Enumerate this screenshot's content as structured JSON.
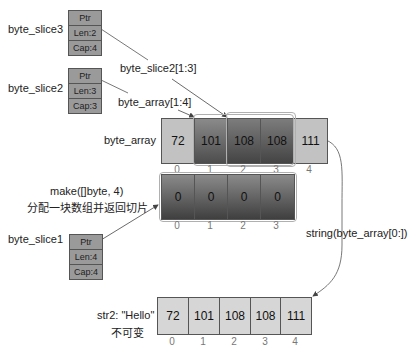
{
  "slices": {
    "byte_slice3": {
      "name": "byte_slice3",
      "ptr": "Ptr",
      "len": "Len:2",
      "cap": "Cap:4"
    },
    "byte_slice2": {
      "name": "byte_slice2",
      "ptr": "Ptr",
      "len": "Len:3",
      "cap": "Cap:3"
    },
    "byte_slice1": {
      "name": "byte_slice1",
      "ptr": "Ptr",
      "len": "Len:4",
      "cap": "Cap:4"
    }
  },
  "annotations": {
    "slice2_expr": "byte_slice2[1:3]",
    "array_expr": "byte_array[1:4]",
    "make_expr": "make([]byte, 4)",
    "make_desc": "分配一块数组并返回切片",
    "string_expr": "string(byte_array[0:])",
    "str2_label": "str2: \"Hello\"",
    "str2_desc": "不可变"
  },
  "byte_array": {
    "label": "byte_array",
    "values": [
      "72",
      "101",
      "108",
      "108",
      "111"
    ],
    "indices": [
      "0",
      "1",
      "2",
      "3",
      "4"
    ]
  },
  "make_array": {
    "values": [
      "0",
      "0",
      "0",
      "0"
    ],
    "indices": [
      "0",
      "1",
      "2",
      "3"
    ]
  },
  "str2_array": {
    "values": [
      "72",
      "101",
      "108",
      "108",
      "111"
    ],
    "indices": [
      "0",
      "1",
      "2",
      "3",
      "4"
    ]
  },
  "colors": {
    "light_cell": "#c2c2c2",
    "dark_cell": "#4d4d4d",
    "string_cell": "#d6d6d6",
    "header_box": "#9a9a9a"
  }
}
